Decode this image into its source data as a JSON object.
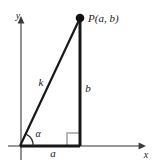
{
  "figure": {
    "background_color": "#ffffff",
    "stroke_color": "#1a1a1a",
    "axis_color": "#6e6e6e",
    "right_angle_color": "#9a9a9a",
    "axes": {
      "y_label": "y",
      "x_label": "x"
    },
    "point": {
      "label": "P(a, b)",
      "dot_radius": 4,
      "x": 80,
      "y": 18
    },
    "sides": {
      "hypotenuse_label": "k",
      "vertical_label": "b",
      "horizontal_label": "a"
    },
    "angle": {
      "label": "α",
      "arc_radius": 13
    },
    "right_angle_marker": {
      "size": 13
    },
    "geometry": {
      "origin_x": 20,
      "origin_y": 146,
      "apex_x": 80,
      "apex_y": 18,
      "x_axis_start": 8,
      "x_axis_end": 145,
      "y_axis_top": 17,
      "y_axis_bottom": 160
    }
  }
}
